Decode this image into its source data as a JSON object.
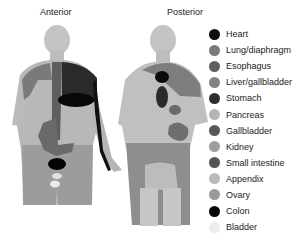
{
  "figure": {
    "views": [
      {
        "id": "anterior",
        "label": "Anterior"
      },
      {
        "id": "posterior",
        "label": "Posterior"
      }
    ]
  },
  "legend": {
    "items": [
      {
        "label": "Heart",
        "color": "#0d0d0d"
      },
      {
        "label": "Lung/diaphragm",
        "color": "#7a7a7a"
      },
      {
        "label": "Esophagus",
        "color": "#5e5e5e"
      },
      {
        "label": "Liver/gallbladder",
        "color": "#838383"
      },
      {
        "label": "Stomach",
        "color": "#2e2e2e"
      },
      {
        "label": "Pancreas",
        "color": "#b5b5b5"
      },
      {
        "label": "Gallbladder",
        "color": "#585858"
      },
      {
        "label": "Kidney",
        "color": "#9e9e9e"
      },
      {
        "label": "Small intestine",
        "color": "#555555"
      },
      {
        "label": "Appendix",
        "color": "#b9b9b9"
      },
      {
        "label": "Ovary",
        "color": "#9a9a9a"
      },
      {
        "label": "Colon",
        "color": "#050505"
      },
      {
        "label": "Bladder",
        "color": "#ececec"
      }
    ]
  }
}
